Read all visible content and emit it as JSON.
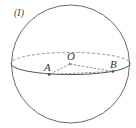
{
  "figure": {
    "label": "(I)",
    "shape": "sphere",
    "center_label": "O",
    "points": [
      {
        "name": "A",
        "on": "equator-front"
      },
      {
        "name": "B",
        "on": "equator-front"
      }
    ],
    "segments": [
      {
        "from": "O",
        "to": "A",
        "style": "dashed"
      },
      {
        "from": "O",
        "to": "B",
        "style": "dashed"
      },
      {
        "from": "A",
        "to": "B",
        "style": "dashed"
      }
    ],
    "colors": {
      "stroke": "#555555",
      "background": "#ffffff"
    }
  }
}
